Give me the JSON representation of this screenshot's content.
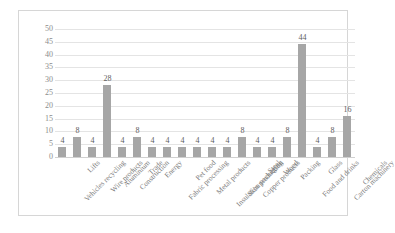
{
  "chart_data": {
    "type": "bar",
    "title": "",
    "xlabel": "",
    "ylabel": "",
    "ylim": [
      0,
      50
    ],
    "ytick_step": 5,
    "yticks": [
      0,
      5,
      10,
      15,
      20,
      25,
      30,
      35,
      40,
      45,
      50
    ],
    "grid": true,
    "legend": false,
    "data_labels": true,
    "bar_color": "#a6a6a6",
    "gridline_color": "#e4e4e4",
    "frame_color": "#d6d6d6",
    "tick_label_color": "#8c8c8c",
    "categories": [
      "Vehicles recycling",
      "Lifts",
      "Wire products",
      "Aluminium",
      "Construction",
      "Trade",
      "Energy",
      "Fabric processing",
      "Pet food",
      "Metal products",
      "Insulation packaging",
      "Skin production",
      "Copper products",
      "Steel",
      "Wood",
      "Packing",
      "Food and drinks",
      "Glass",
      "Carton machinery",
      "Chemicals"
    ],
    "values": [
      4,
      8,
      4,
      28,
      4,
      8,
      4,
      4,
      4,
      4,
      4,
      4,
      8,
      4,
      4,
      8,
      44,
      4,
      8,
      16
    ],
    "value_labels": [
      "4",
      "8",
      "4",
      "28",
      "4",
      "8",
      "4",
      "4",
      "4",
      "4",
      "4",
      "4",
      "8",
      "4",
      "4",
      "8",
      "44",
      "4",
      "8",
      "16"
    ]
  }
}
